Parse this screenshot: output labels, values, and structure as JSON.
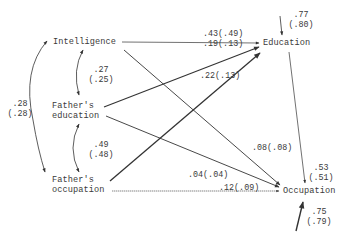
{
  "nodes": {
    "intelligence": "Intelligence",
    "fathers_education_l1": "Father's",
    "fathers_education_l2": "education",
    "fathers_occupation_l1": "Father's",
    "fathers_occupation_l2": "occupation",
    "education": "Education",
    "occupation": "Occupation"
  },
  "correlations": {
    "intel_fedu": {
      "value": ".27",
      "alt": "(.25)"
    },
    "fedu_focc": {
      "value": ".49",
      "alt": "(.48)"
    },
    "intel_focc": {
      "value": ".28",
      "alt": "(.28)"
    }
  },
  "paths": {
    "intel_edu": ".43(.49)",
    "fedu_edu": ".19(.13)",
    "focc_edu": ".22(.13)",
    "intel_occ": ".08(.08)",
    "fedu_occ": ".04(.04)",
    "focc_occ": ".12(.09)",
    "edu_occ": {
      "value": ".53",
      "alt": "(.51)"
    }
  },
  "residuals": {
    "education": {
      "value": ".77",
      "alt": "(.80)"
    },
    "occupation": {
      "value": ".75",
      "alt": "(.79)"
    }
  },
  "colors": {
    "ink": "#333333",
    "background": "#ffffff"
  }
}
